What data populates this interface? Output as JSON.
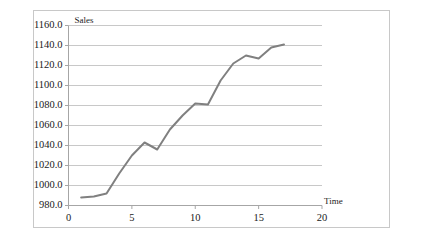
{
  "chart_data": {
    "type": "line",
    "title": "",
    "xlabel": "Time",
    "ylabel": "Sales",
    "grid": true,
    "legend": "none",
    "xlim": [
      0,
      20
    ],
    "ylim": [
      980,
      1160
    ],
    "xticks": [
      0,
      5,
      10,
      15,
      20
    ],
    "xtick_labels": [
      "0",
      "5",
      "10",
      "15",
      "20"
    ],
    "yticks": [
      980,
      1000,
      1020,
      1040,
      1060,
      1080,
      1100,
      1120,
      1140,
      1160
    ],
    "ytick_labels": [
      "980.0",
      "1000.0",
      "1020.0",
      "1040.0",
      "1060.0",
      "1080.0",
      "1100.0",
      "1120.0",
      "1140.0",
      "1160.0"
    ],
    "series": [
      {
        "name": "Sales",
        "color": "#808080",
        "x": [
          1,
          2,
          3,
          4,
          5,
          6,
          7,
          8,
          9,
          10,
          11,
          12,
          13,
          14,
          15,
          16,
          17
        ],
        "values": [
          988,
          989,
          992,
          1012,
          1030,
          1043,
          1036,
          1056,
          1070,
          1082,
          1081,
          1105,
          1122,
          1130,
          1127,
          1138,
          1141
        ]
      }
    ]
  },
  "labels": {
    "y_axis_title": "Sales",
    "x_axis_title": "Time"
  },
  "colors": {
    "line": "#808080",
    "grid": "#b0b0b0",
    "axis": "#a6a6a6",
    "border": "#c8c8c8",
    "text": "#1a1a1a",
    "background": "#ffffff"
  }
}
